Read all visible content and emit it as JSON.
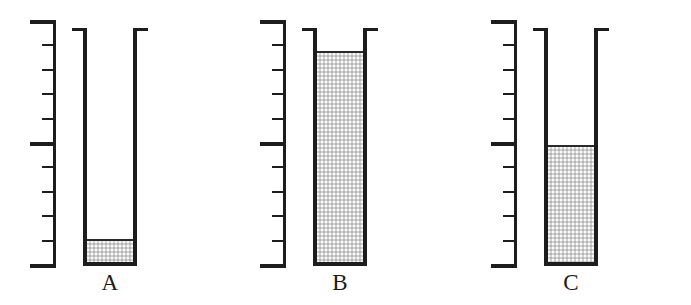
{
  "figure": {
    "background_color": "#ffffff",
    "ink_color": "#1d1d1d",
    "liquid_color": "#d2d2d2",
    "scale": {
      "name": "vertical-graduated-scale",
      "total_divisions": 10,
      "tick_count": 11,
      "major_tick_indices": [
        0,
        5,
        10
      ],
      "tick_values": [
        10,
        9,
        8,
        7,
        6,
        5,
        4,
        3,
        2,
        1,
        0
      ],
      "minor_tick_length_px": 14,
      "major_tick_length_px": 26
    },
    "containers": [
      {
        "label": "A",
        "name": "container-a",
        "fill_units": 1,
        "fill_fraction": 0.1,
        "liquid_top_y": 200,
        "liquid_bottom_y": 262,
        "group_left": 0
      },
      {
        "label": "B",
        "name": "container-b",
        "fill_units": 9,
        "fill_fraction": 0.9,
        "liquid_top_y": 50,
        "liquid_bottom_y": 262,
        "group_left": 230
      },
      {
        "label": "C",
        "name": "container-c",
        "fill_units": 5,
        "fill_fraction": 0.5,
        "liquid_top_y": 142,
        "liquid_bottom_y": 262,
        "group_left": 461
      }
    ]
  },
  "chart_data": {
    "type": "bar",
    "xlabel": "",
    "ylabel": "Level (scale divisions)",
    "categories": [
      "A",
      "B",
      "C"
    ],
    "values": [
      1,
      9,
      5
    ],
    "ylim": [
      0,
      10
    ],
    "tick_labels": [
      "0",
      "1",
      "2",
      "3",
      "4",
      "5",
      "6",
      "7",
      "8",
      "9",
      "10"
    ],
    "grid": false,
    "legend": null,
    "annotations": [
      "Each container is drawn beside an identical vertical scale of 10 divisions.",
      "Container A is filled to 1 division.",
      "Container B is filled to 9 divisions.",
      "Container C is filled to 5 divisions."
    ]
  }
}
